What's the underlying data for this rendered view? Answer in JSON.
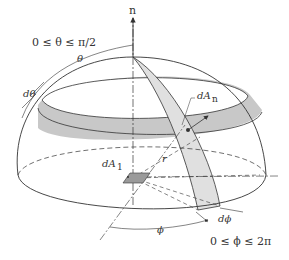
{
  "diagram": {
    "labels": {
      "normal": "n",
      "theta_range": "0 ≤ θ ≤ π/2",
      "theta": "θ",
      "d_theta": "dθ",
      "dA_n": "dA",
      "dA_n_sub": "n",
      "dA_1": "dA",
      "dA_1_sub": "1",
      "r": "r",
      "phi": "ϕ",
      "d_phi": "dϕ",
      "phi_range": "0 ≤ ϕ ≤ 2π"
    },
    "colors": {
      "line": "#333333",
      "band_fill": "#c8c8c8",
      "strip_fill": "#e0e0e0",
      "element_fill": "#9a9a9a",
      "background": "#ffffff"
    }
  }
}
